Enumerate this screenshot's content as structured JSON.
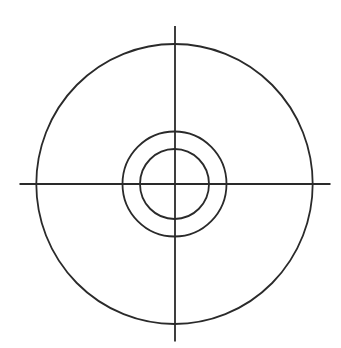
{
  "diagram": {
    "type": "concentric-circles-with-crosshair",
    "canvas": {
      "width": 341,
      "height": 348,
      "background": "#ffffff"
    },
    "stroke": {
      "color": "#2a2a2a",
      "width": 1.8
    },
    "center": {
      "x": 174.5,
      "y": 184
    },
    "circles": [
      {
        "name": "outer-circle",
        "rx": 138.2,
        "ry": 140
      },
      {
        "name": "middle-circle",
        "rx": 52,
        "ry": 52.5
      },
      {
        "name": "inner-circle",
        "rx": 34.5,
        "ry": 35
      }
    ],
    "crosshair": {
      "horizontal": {
        "x1": 19.5,
        "x2": 330.5,
        "y": 184
      },
      "vertical": {
        "x": 175,
        "y1": 26,
        "y2": 341.5
      }
    }
  }
}
